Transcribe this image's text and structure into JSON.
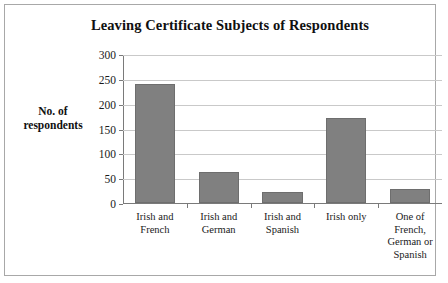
{
  "chart_data": {
    "type": "bar",
    "title": "Leaving Certificate Subjects of Respondents",
    "xlabel": "",
    "ylabel": "No. of respondents",
    "ylabel_lines": [
      "No. of",
      "respondents"
    ],
    "categories": [
      "Irish and French",
      "Irish and German",
      "Irish and Spanish",
      "Irish only",
      "One of French, German or Spanish"
    ],
    "category_lines": [
      [
        "Irish and",
        "French"
      ],
      [
        "Irish and",
        "German"
      ],
      [
        "Irish and",
        "Spanish"
      ],
      [
        "Irish only"
      ],
      [
        "One of",
        "French,",
        "German or",
        "Spanish"
      ]
    ],
    "values": [
      240,
      62,
      22,
      172,
      28
    ],
    "ylim": [
      0,
      300
    ],
    "yticks": [
      0,
      50,
      100,
      150,
      200,
      250,
      300
    ],
    "ytick_labels": [
      "0",
      "50",
      "100",
      "150",
      "200",
      "250",
      "300"
    ],
    "grid": true,
    "legend": false,
    "colors": {
      "bar_fill": "#808080",
      "bar_border": "#6e6e6e",
      "gridline": "#c9c9c9",
      "axis": "#7a7a7a",
      "text": "#1a1a1a",
      "frame": "#a8a8a8",
      "background": "#ffffff"
    }
  }
}
